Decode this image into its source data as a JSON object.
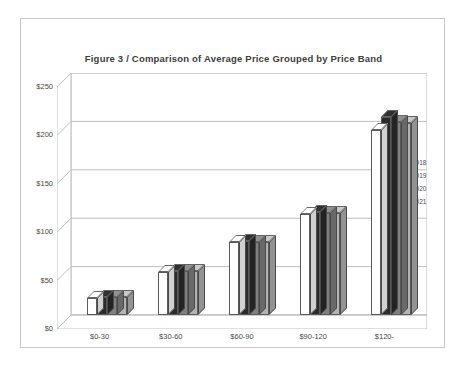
{
  "figure": {
    "title": "Figure 3  /  Comparison of Average Price Grouped by Price Band"
  },
  "legend": {
    "position": "right",
    "entries": [
      {
        "label": "2018",
        "color": "#ffffff"
      },
      {
        "label": "2019",
        "color": "#2b2b2b"
      },
      {
        "label": "2020",
        "color": "#808080"
      },
      {
        "label": "2021",
        "color": "#b3b3b3"
      }
    ]
  },
  "chart_data": {
    "type": "bar",
    "title": "Figure 3  /  Comparison of Average Price Grouped by Price Band",
    "xlabel": "",
    "ylabel": "",
    "ylim": [
      0,
      250
    ],
    "yticks": [
      0,
      50,
      100,
      150,
      200,
      250
    ],
    "ytick_labels": [
      "$0",
      "$50",
      "$100",
      "$150",
      "$200",
      "$250"
    ],
    "grid": true,
    "grid_axis": "y",
    "three_d": true,
    "categories": [
      "$0-30",
      "$30-60",
      "$60-90",
      "$90-120",
      "$120-"
    ],
    "series": [
      {
        "name": "2018",
        "color": "#ffffff",
        "values": [
          18,
          44,
          75,
          104,
          191
        ]
      },
      {
        "name": "2019",
        "color": "#2b2b2b",
        "values": [
          19,
          45,
          76,
          106,
          205
        ]
      },
      {
        "name": "2020",
        "color": "#808080",
        "values": [
          19,
          45,
          75,
          105,
          199
        ]
      },
      {
        "name": "2021",
        "color": "#b3b3b3",
        "values": [
          19,
          45,
          75,
          105,
          198
        ]
      }
    ]
  }
}
